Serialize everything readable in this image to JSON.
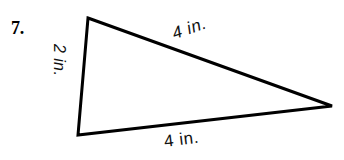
{
  "problem": {
    "number_label": "7."
  },
  "figure": {
    "shape_name": "triangle",
    "stroke_color": "#000000",
    "fill_color": "#ffffff",
    "stroke_width": 3,
    "vertices": {
      "top": {
        "x": 88,
        "y": 18
      },
      "bottom_left": {
        "x": 78,
        "y": 135
      },
      "right": {
        "x": 332,
        "y": 106
      }
    },
    "labels": {
      "left_side": "2 in.",
      "top_right_side": "4 in.",
      "bottom_side": "4 in."
    }
  },
  "icons": {
    "triangle_outline": "triangle-outline-icon"
  }
}
